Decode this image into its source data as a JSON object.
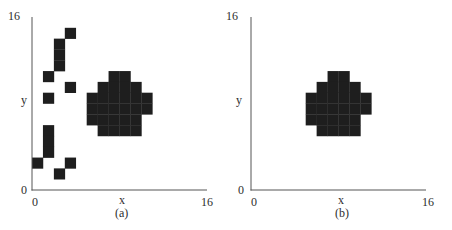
{
  "figure": {
    "panels": [
      {
        "caption": "(a)",
        "x_axis": {
          "label": "x",
          "min_label": "0",
          "max_label": "16"
        },
        "y_axis": {
          "label": "y",
          "min_label": "0",
          "max_label": "16"
        },
        "grid_size": 16,
        "fill_color": "#1e1e1e",
        "cells": [
          [
            3,
            14
          ],
          [
            2,
            13
          ],
          [
            2,
            12
          ],
          [
            2,
            11
          ],
          [
            1,
            10
          ],
          [
            3,
            9
          ],
          [
            1,
            8
          ],
          [
            1,
            5
          ],
          [
            1,
            4
          ],
          [
            1,
            3
          ],
          [
            0,
            2
          ],
          [
            3,
            2
          ],
          [
            2,
            1
          ],
          [
            7,
            10
          ],
          [
            8,
            10
          ],
          [
            6,
            9
          ],
          [
            7,
            9
          ],
          [
            8,
            9
          ],
          [
            9,
            9
          ],
          [
            5,
            8
          ],
          [
            6,
            8
          ],
          [
            7,
            8
          ],
          [
            8,
            8
          ],
          [
            9,
            8
          ],
          [
            10,
            8
          ],
          [
            5,
            7
          ],
          [
            6,
            7
          ],
          [
            7,
            7
          ],
          [
            8,
            7
          ],
          [
            9,
            7
          ],
          [
            10,
            7
          ],
          [
            5,
            6
          ],
          [
            6,
            6
          ],
          [
            7,
            6
          ],
          [
            8,
            6
          ],
          [
            9,
            6
          ],
          [
            6,
            5
          ],
          [
            7,
            5
          ],
          [
            8,
            5
          ],
          [
            9,
            5
          ]
        ]
      },
      {
        "caption": "(b)",
        "x_axis": {
          "label": "x",
          "min_label": "0",
          "max_label": "16"
        },
        "y_axis": {
          "label": "y",
          "min_label": "0",
          "max_label": "16"
        },
        "grid_size": 16,
        "fill_color": "#1e1e1e",
        "cells": [
          [
            7,
            10
          ],
          [
            8,
            10
          ],
          [
            6,
            9
          ],
          [
            7,
            9
          ],
          [
            8,
            9
          ],
          [
            9,
            9
          ],
          [
            5,
            8
          ],
          [
            6,
            8
          ],
          [
            7,
            8
          ],
          [
            8,
            8
          ],
          [
            9,
            8
          ],
          [
            10,
            8
          ],
          [
            5,
            7
          ],
          [
            6,
            7
          ],
          [
            7,
            7
          ],
          [
            8,
            7
          ],
          [
            9,
            7
          ],
          [
            10,
            7
          ],
          [
            5,
            6
          ],
          [
            6,
            6
          ],
          [
            7,
            6
          ],
          [
            8,
            6
          ],
          [
            9,
            6
          ],
          [
            6,
            5
          ],
          [
            7,
            5
          ],
          [
            8,
            5
          ],
          [
            9,
            5
          ]
        ]
      }
    ]
  }
}
